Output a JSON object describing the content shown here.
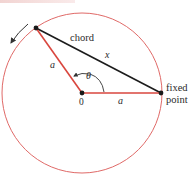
{
  "diagram": {
    "labels": {
      "chord": "chord",
      "chord_length": "x",
      "radius_left": "a",
      "radius_bottom": "a",
      "angle": "θ",
      "center": "0",
      "fixed_point_line1": "fixed",
      "fixed_point_line2": "point"
    },
    "colors": {
      "circle": "#e06a68",
      "radius": "#d9463e",
      "chord": "#1c1c1c",
      "points": "#1a1a1a",
      "arrow": "#333333"
    },
    "geometry": {
      "center": [
        82,
        93
      ],
      "radius": 79,
      "moving_point": [
        36,
        28
      ],
      "fixed_point": [
        161,
        93
      ]
    }
  }
}
